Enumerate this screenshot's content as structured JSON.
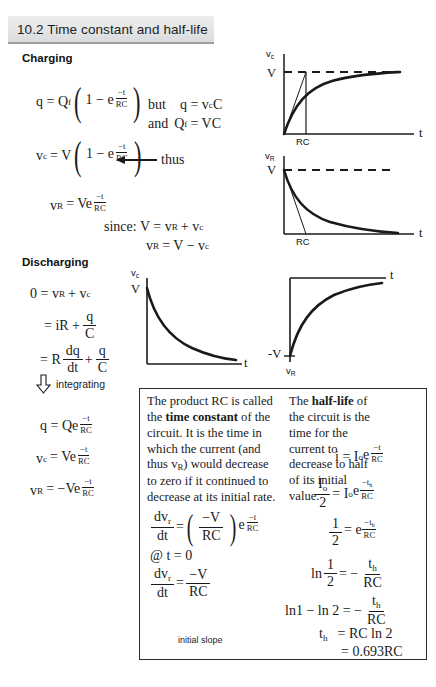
{
  "slide": {
    "title": "10.2 Time constant and half-life",
    "section_charging": "Charging",
    "section_discharging": "Discharging"
  },
  "charging": {
    "eq1_lhs": "q = Q",
    "eq1_lhs_sub": "f",
    "eq1_inner_one": "1 − e",
    "exp_num": "−t",
    "exp_den": "RC",
    "note_but": "but",
    "note_q": "q = v",
    "note_q_sub": "c",
    "note_q_tail": "C",
    "note_and": "and",
    "note_Qf": "Q",
    "note_Qf_sub": "f",
    "note_Qf_tail": "= VC",
    "eq2_lhs": "v",
    "eq2_lhs_sub": "c",
    "eq2_eq": "= V",
    "thus_label": "thus",
    "eq3_lhs": "v",
    "eq3_lhs_sub": "R",
    "eq3_rhs": "= Ve",
    "since_line1_pre": "since:  V = v",
    "since_line1_sub": "R",
    "since_line1_mid": "+ v",
    "since_line1_sub2": "c",
    "since_line2_pre": "v",
    "since_line2_sub": "R",
    "since_line2_mid": "= V − v",
    "since_line2_sub2": "c"
  },
  "discharging": {
    "line1_a": "0 = v",
    "line1_sub1": "R",
    "line1_b": "+ v",
    "line1_sub2": "c",
    "line2": "= iR +",
    "line2_num": "q",
    "line2_den": "C",
    "line3": "= R",
    "line3_num1": "dq",
    "line3_den1": "dt",
    "line3_plus": "+",
    "line3_num2": "q",
    "line3_den2": "C",
    "integrating": "integrating",
    "res1": "q = Qe",
    "res2_lhs": "v",
    "res2_sub": "c",
    "res2_rhs": "= Ve",
    "res3_lhs": "v",
    "res3_sub": "R",
    "res3_rhs": "= −Ve",
    "exp_num": "−t",
    "exp_den": "RC"
  },
  "graphs": {
    "g1": {
      "y_label": "v",
      "y_sub": "c",
      "y_value": "V",
      "x_label": "t",
      "tau_label": "RC",
      "kind": "charging-capacitor"
    },
    "g2": {
      "y_label": "v",
      "y_sub": "R",
      "y_value": "V",
      "x_label": "t",
      "tau_label": "RC",
      "kind": "charging-resistor"
    },
    "g3": {
      "y_label": "v",
      "y_sub": "c",
      "y_value": "V",
      "x_label": "t",
      "kind": "discharging-capacitor"
    },
    "g4": {
      "y_label": "v",
      "y_sub": "R",
      "y_value": "-V",
      "x_label": "t",
      "kind": "discharging-resistor"
    }
  },
  "time_constant_box": {
    "p1_a": "The product RC is called the ",
    "p1_bold": "time constant",
    "p1_b": " of the circuit. It is the time in which the current (and thus v",
    "p1_sub": "R",
    "p1_c": ") would decrease to zero if it continued to decrease at its initial rate.",
    "eq_lhs_num": "dv",
    "eq_lhs_num_sub": "r",
    "eq_lhs_den": "dt",
    "eq_eq": "=",
    "eq_paren_num": "−V",
    "eq_paren_den": "RC",
    "eq_e": "e",
    "eq_exp_num": "−t",
    "eq_exp_den": "RC",
    "at_t": "@ t = 0",
    "eq2_lhs_num": "dv",
    "eq2_lhs_num_sub": "r",
    "eq2_lhs_den": "dt",
    "eq2_rhs_num": "−V",
    "eq2_rhs_den": "RC",
    "caption": "initial slope"
  },
  "half_life_box": {
    "p1_a": "The ",
    "p1_bold": "half-life",
    "p1_b": " of the circuit is the time for the current to decrease to half of its initial value.",
    "eq1_lhs": "i = I",
    "eq1_sub": "o",
    "eq1_e": "e",
    "exp_num": "−t",
    "exp_den": "RC",
    "eq2_num": "I",
    "eq2_num_sub": "o",
    "eq2_den": "2",
    "eq2_rhs": "= I",
    "eq2_rhs_sub": "o",
    "eq2_e": "e",
    "exp_th_num": "−t",
    "exp_th_sub": "h",
    "eq3_num": "1",
    "eq3_den": "2",
    "eq3_rhs": "= e",
    "eq4_ln": "ln",
    "eq4_num": "1",
    "eq4_den": "2",
    "eq4_eq": "= −",
    "eq4_rnum": "t",
    "eq4_rnum_sub": "h",
    "eq4_rden": "RC",
    "eq5_lhs": "ln1 − ln 2 = −",
    "eq6_lhs": "t",
    "eq6_sub": "h",
    "eq6_rhs": "= RC ln 2",
    "eq7": "= 0.693RC"
  },
  "colors": {
    "ink": "#1a1a1a",
    "title_bg": "#e6e7e8",
    "box_border": "#2b2b2b"
  }
}
